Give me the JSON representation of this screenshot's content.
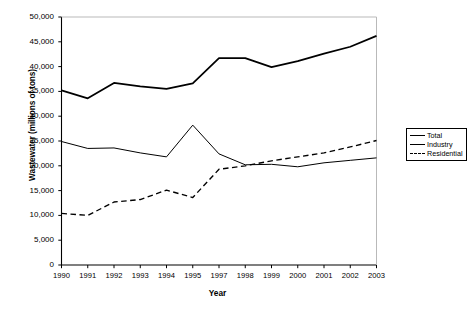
{
  "chart_data": {
    "type": "line",
    "title": "",
    "xlabel": "Year",
    "ylabel": "Wastewater (millions of tons)",
    "categories": [
      "1990",
      "1991",
      "1992",
      "1993",
      "1994",
      "1995",
      "1997",
      "1998",
      "1999",
      "2000",
      "2001",
      "2002",
      "2003"
    ],
    "xtick_labels": [
      "1990",
      "1991",
      "1992",
      "1993",
      "1994",
      "1995",
      "1997",
      "1998",
      "1999",
      "2000",
      "2001",
      "2002",
      "2003"
    ],
    "ytick_labels": [
      "50,000",
      "45,000",
      "40,000",
      "35,000",
      "30,000",
      "25,000",
      "20,000",
      "15,000",
      "10,000",
      "5,000",
      "0"
    ],
    "ytick_values": [
      50000,
      45000,
      40000,
      35000,
      30000,
      25000,
      20000,
      15000,
      10000,
      5000,
      0
    ],
    "ylim": [
      0,
      50000
    ],
    "grid": false,
    "legend_position": "right",
    "series": [
      {
        "name": "Total",
        "style": "solid-thick",
        "color": "#000000",
        "values": [
          35200,
          33600,
          36700,
          36000,
          35500,
          36600,
          41700,
          41700,
          39900,
          41100,
          42600,
          44000,
          46200
        ]
      },
      {
        "name": "Industry",
        "style": "solid-thin",
        "color": "#000000",
        "values": [
          24900,
          23500,
          23600,
          22600,
          21800,
          28200,
          22400,
          20200,
          20300,
          19800,
          20600,
          21100,
          21600
        ]
      },
      {
        "name": "Residential",
        "style": "dashed",
        "color": "#000000",
        "values": [
          10400,
          10000,
          12700,
          13200,
          15100,
          13600,
          19300,
          20000,
          21000,
          21800,
          22600,
          23800,
          25100
        ]
      }
    ]
  },
  "legend": {
    "items": [
      {
        "label": "Total"
      },
      {
        "label": "Industry"
      },
      {
        "label": "Residential"
      }
    ]
  }
}
